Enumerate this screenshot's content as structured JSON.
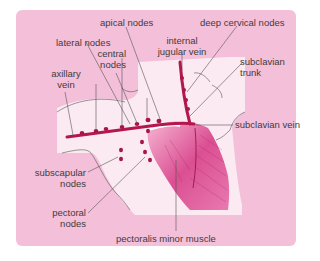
{
  "diagram": {
    "colors": {
      "panel": "#f4bfd9",
      "inner_region": "#fbeaf2",
      "vein": "#b3174d",
      "node": "#a8154a",
      "muscle_dark": "#d43f86",
      "muscle_light": "#f3a9cb",
      "label_text": "#3d3d3d",
      "leader_line": "#555555"
    },
    "labels": {
      "apical_nodes": "apical nodes",
      "deep_cervical_nodes": "deep cervical nodes",
      "lateral_nodes": "lateral nodes",
      "internal_jugular_vein_1": "internal",
      "internal_jugular_vein_2": "jugular vein",
      "central_nodes_1": "central",
      "central_nodes_2": "nodes",
      "subclavian_trunk_1": "subclavian",
      "subclavian_trunk_2": "trunk",
      "axillary_vein_1": "axillary",
      "axillary_vein_2": "vein",
      "subclavian_vein": "subclavian vein",
      "subscapular_nodes_1": "subscapular",
      "subscapular_nodes_2": "nodes",
      "pectoral_nodes_1": "pectoral",
      "pectoral_nodes_2": "nodes",
      "pectoralis_minor_muscle": "pectoralis minor muscle"
    }
  }
}
